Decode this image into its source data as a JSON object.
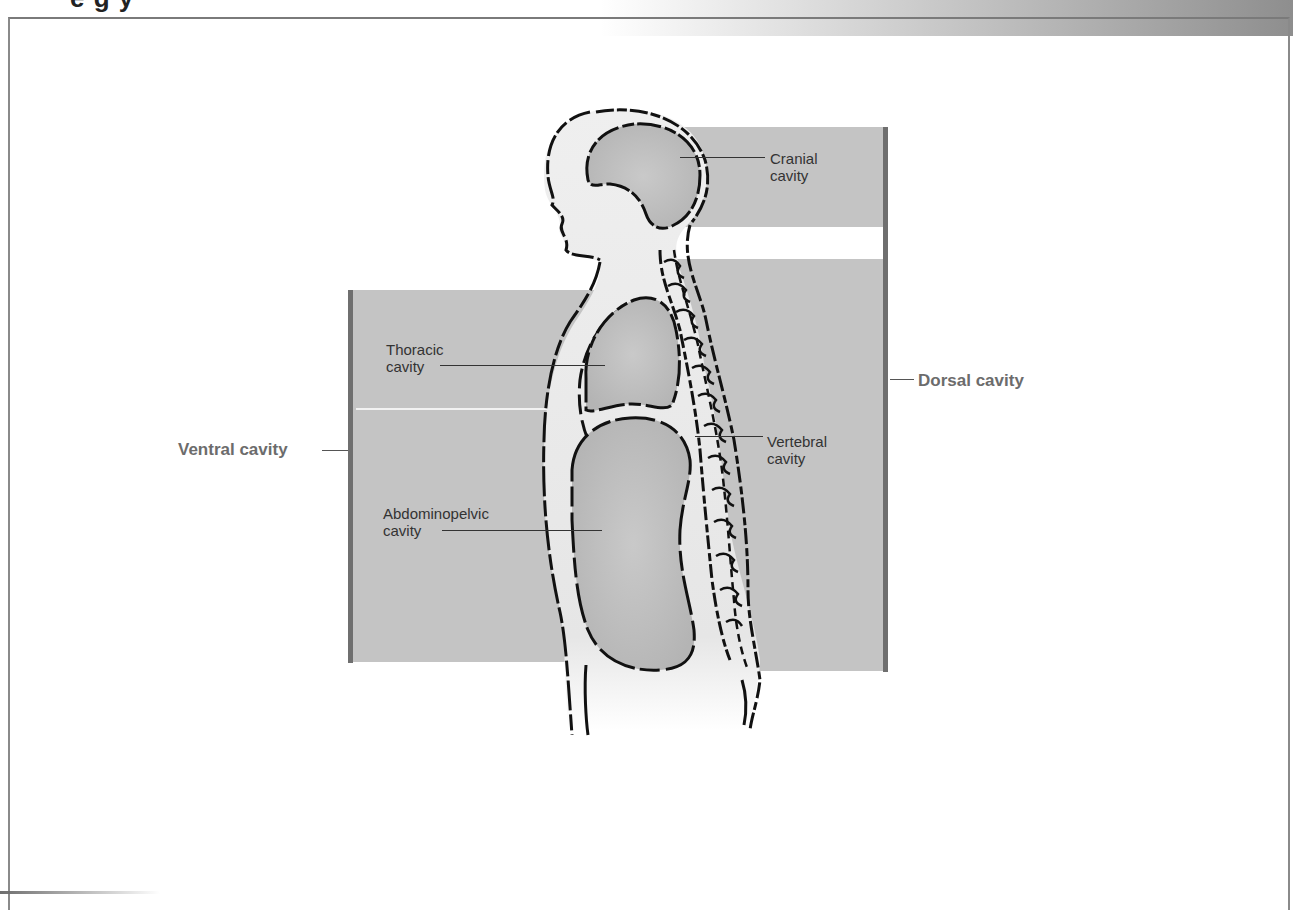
{
  "page": {
    "title_fragment": "e g  y",
    "header_band_color": "#8e8e8e",
    "frame_color": "#8a8a8a"
  },
  "diagram": {
    "panel_color": "#c4c4c4",
    "bracket_color": "#6f6f6f",
    "outline_color": "#111111",
    "groups": [
      {
        "id": "ventral",
        "label": "Ventral cavity",
        "members": [
          "thoracic",
          "abdominopelvic"
        ]
      },
      {
        "id": "dorsal",
        "label": "Dorsal cavity",
        "members": [
          "cranial",
          "vertebral"
        ]
      }
    ],
    "labels": {
      "cranial": "Cranial\ncavity",
      "thoracic": "Thoracic\ncavity",
      "abdominopelvic": "Abdominopelvic\ncavity",
      "vertebral": "Vertebral\ncavity",
      "ventral": "Ventral cavity",
      "dorsal": "Dorsal cavity"
    }
  }
}
